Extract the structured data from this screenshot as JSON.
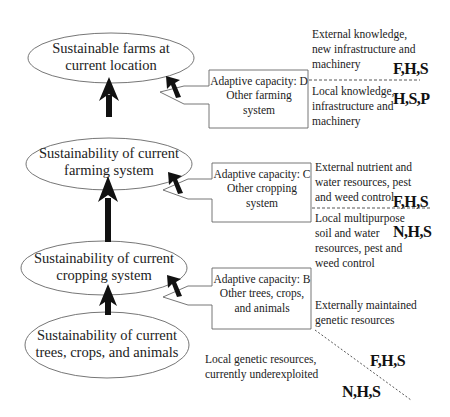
{
  "levels": [
    {
      "id": "farms",
      "label": "Sustainable farms at current location"
    },
    {
      "id": "farming",
      "label": "Sustainability of current farming system"
    },
    {
      "id": "cropping",
      "label": "Sustainability of current cropping system"
    },
    {
      "id": "trees",
      "label": "Sustainability of current trees, crops, and animals"
    }
  ],
  "ellipses": {
    "farms": {
      "line1": "Sustainable farms at",
      "line2": "current location"
    },
    "farming": {
      "line1": "Sustainability of current",
      "line2": "farming system"
    },
    "cropping": {
      "line1": "Sustainability of current",
      "line2": "cropping system"
    },
    "trees": {
      "line1": "Sustainability of current",
      "line2": "trees, crops, and animals"
    }
  },
  "boxes": {
    "D": {
      "line1": "Adaptive capacity: D",
      "line2": "Other farming",
      "line3": "system"
    },
    "C": {
      "line1": "Adaptive capacity: C",
      "line2": "Other cropping",
      "line3": "system"
    },
    "B": {
      "line1": "Adaptive capacity: B",
      "line2": "Other trees, crops,",
      "line3": "and animals"
    }
  },
  "resources": {
    "D_external": {
      "line1": "External knowledge,",
      "line2": "new infrastructure and",
      "line3": "machinery",
      "code": "F,H,S"
    },
    "D_local": {
      "line1": "Local knowledge,",
      "line2": "infrastructure and",
      "line3": "machinery",
      "code": "H,S,P"
    },
    "C_external": {
      "line1": "External nutrient and",
      "line2": "water resources, pest",
      "line3": "and weed control",
      "code": "F,H,S"
    },
    "C_local": {
      "line1": "Local multipurpose",
      "line2": "soil and water",
      "line3": "resources, pest and",
      "line4": "weed control",
      "code": "N,H,S"
    },
    "B_external": {
      "line1": "Externally maintained",
      "line2": "genetic resources",
      "code": "F,H,S"
    },
    "B_local": {
      "line1": "Local genetic resources,",
      "line2": "currently underexploited",
      "code": "N,H,S"
    }
  },
  "colors": {
    "stroke": "#555555",
    "arrow": "#111111",
    "text": "#222222"
  }
}
